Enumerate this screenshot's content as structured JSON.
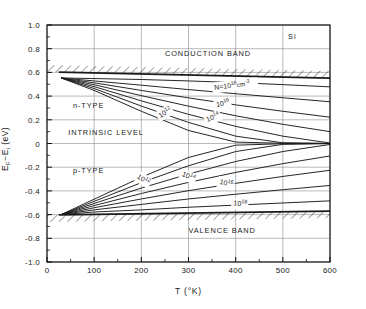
{
  "chart_data": {
    "type": "line",
    "title": "",
    "material_label": "Si",
    "xlabel": "T  (°K)",
    "ylabel_parts": {
      "main1": "E",
      "sub1": "F",
      "dash": "−",
      "main2": "E",
      "sub2": "i",
      "units": "  (eV)"
    },
    "ylabel": "E_F − E_i  (eV)",
    "xlim": [
      0,
      600
    ],
    "ylim": [
      -1.0,
      1.0
    ],
    "xticks": [
      0,
      100,
      200,
      300,
      400,
      500,
      600
    ],
    "xtick_labels": [
      "0",
      "100",
      "200",
      "300",
      "400",
      "500",
      "600"
    ],
    "xminor_step": 50,
    "yticks": [
      1.0,
      0.8,
      0.6,
      0.4,
      0.2,
      0,
      -0.2,
      -0.4,
      -0.6,
      -0.8,
      -1.0
    ],
    "ytick_labels": [
      "1.0",
      "0.8",
      "0.6",
      "0.4",
      "0.2",
      "0",
      "-0.2",
      "-0.4",
      "-0.6",
      "-0.8",
      "-1.0"
    ],
    "yminor_step": 0.1,
    "grid": true,
    "legend": "none",
    "annotations": [
      {
        "name": "conduction-band-label",
        "text": "CONDUCTION BAND",
        "x": 250,
        "y": 0.735
      },
      {
        "name": "valence-band-label",
        "text": "VALENCE BAND",
        "x": 300,
        "y": -0.755
      },
      {
        "name": "n-type-label",
        "text": "n-TYPE",
        "x": 55,
        "y": 0.3
      },
      {
        "name": "p-type-label",
        "text": "p-TYPE",
        "x": 55,
        "y": -0.245
      },
      {
        "name": "intrinsic-level-label",
        "text": "INTRINSIC LEVEL",
        "x": 45,
        "y": 0.075
      },
      {
        "name": "material-label",
        "text": "Si",
        "x": 520,
        "y": 0.885
      }
    ],
    "band_edges": [
      {
        "name": "conduction-band-edge",
        "points": [
          [
            25,
            0.603
          ],
          [
            600,
            0.552
          ]
        ],
        "hatch_side": "above"
      },
      {
        "name": "valence-band-edge",
        "points": [
          [
            25,
            -0.603
          ],
          [
            600,
            -0.57
          ]
        ],
        "hatch_side": "below"
      }
    ],
    "converge_point_n": [
      30,
      0.553
    ],
    "converge_point_p": [
      30,
      -0.6
    ],
    "series": [
      {
        "name": "n-type N=1e18",
        "label": "N=10",
        "label_exp": "18",
        "label_units": "cm",
        "label_units_exp": "-3",
        "doping": 1e+18,
        "type": "n",
        "points": [
          [
            30,
            0.553
          ],
          [
            100,
            0.548
          ],
          [
            200,
            0.54
          ],
          [
            300,
            0.528
          ],
          [
            400,
            0.514
          ],
          [
            500,
            0.497
          ],
          [
            600,
            0.478
          ]
        ]
      },
      {
        "name": "n-type 1e17",
        "label": "",
        "doping": 1e+17,
        "type": "n",
        "points": [
          [
            30,
            0.553
          ],
          [
            100,
            0.528
          ],
          [
            200,
            0.492
          ],
          [
            300,
            0.455
          ],
          [
            400,
            0.42
          ],
          [
            500,
            0.386
          ],
          [
            600,
            0.352
          ]
        ]
      },
      {
        "name": "n-type 1e16",
        "label": "10",
        "label_exp": "16",
        "doping": 1e+16,
        "type": "n",
        "points": [
          [
            30,
            0.553
          ],
          [
            100,
            0.512
          ],
          [
            200,
            0.448
          ],
          [
            300,
            0.385
          ],
          [
            400,
            0.326
          ],
          [
            500,
            0.272
          ],
          [
            600,
            0.222
          ]
        ]
      },
      {
        "name": "n-type 1e15",
        "label": "",
        "doping": 1000000000000000.0,
        "type": "n",
        "points": [
          [
            30,
            0.553
          ],
          [
            100,
            0.496
          ],
          [
            200,
            0.404
          ],
          [
            300,
            0.315
          ],
          [
            400,
            0.234
          ],
          [
            500,
            0.162
          ],
          [
            600,
            0.1
          ]
        ]
      },
      {
        "name": "n-type 1e14",
        "label": "10",
        "label_exp": "14",
        "doping": 100000000000000.0,
        "type": "n",
        "points": [
          [
            30,
            0.553
          ],
          [
            100,
            0.48
          ],
          [
            200,
            0.36
          ],
          [
            300,
            0.246
          ],
          [
            400,
            0.145
          ],
          [
            500,
            0.062
          ],
          [
            600,
            0.004
          ]
        ]
      },
      {
        "name": "n-type 1e13",
        "label": "",
        "doping": 10000000000000.0,
        "type": "n",
        "points": [
          [
            30,
            0.553
          ],
          [
            100,
            0.464
          ],
          [
            200,
            0.316
          ],
          [
            300,
            0.178
          ],
          [
            400,
            0.062
          ],
          [
            500,
            0.006
          ],
          [
            600,
            0.001
          ]
        ]
      },
      {
        "name": "n-type 1e12",
        "label": "10",
        "label_exp": "12",
        "doping": 1000000000000.0,
        "type": "n",
        "points": [
          [
            30,
            0.553
          ],
          [
            100,
            0.448
          ],
          [
            200,
            0.272
          ],
          [
            300,
            0.11
          ],
          [
            400,
            0.012
          ],
          [
            500,
            0.002
          ],
          [
            600,
            0.0
          ]
        ]
      },
      {
        "name": "p-type 1e12",
        "label": "10",
        "label_exp": "12",
        "doping": 1000000000000.0,
        "type": "p",
        "points": [
          [
            30,
            -0.6
          ],
          [
            100,
            -0.47
          ],
          [
            200,
            -0.285
          ],
          [
            300,
            -0.118
          ],
          [
            400,
            -0.014
          ],
          [
            500,
            -0.002
          ],
          [
            600,
            0.0
          ]
        ]
      },
      {
        "name": "p-type 1e13",
        "label": "",
        "doping": 10000000000000.0,
        "type": "p",
        "points": [
          [
            30,
            -0.6
          ],
          [
            100,
            -0.488
          ],
          [
            200,
            -0.33
          ],
          [
            300,
            -0.188
          ],
          [
            400,
            -0.068
          ],
          [
            500,
            -0.007
          ],
          [
            600,
            -0.001
          ]
        ]
      },
      {
        "name": "p-type 1e14",
        "label": "10",
        "label_exp": "14",
        "doping": 100000000000000.0,
        "type": "p",
        "points": [
          [
            30,
            -0.6
          ],
          [
            100,
            -0.506
          ],
          [
            200,
            -0.376
          ],
          [
            300,
            -0.258
          ],
          [
            400,
            -0.152
          ],
          [
            500,
            -0.068
          ],
          [
            600,
            -0.008
          ]
        ]
      },
      {
        "name": "p-type 1e15",
        "label": "",
        "doping": 1000000000000000.0,
        "type": "p",
        "points": [
          [
            30,
            -0.6
          ],
          [
            100,
            -0.524
          ],
          [
            200,
            -0.422
          ],
          [
            300,
            -0.328
          ],
          [
            400,
            -0.244
          ],
          [
            500,
            -0.17
          ],
          [
            600,
            -0.105
          ]
        ]
      },
      {
        "name": "p-type 1e16",
        "label": "10",
        "label_exp": "16",
        "doping": 1e+16,
        "type": "p",
        "points": [
          [
            30,
            -0.6
          ],
          [
            100,
            -0.542
          ],
          [
            200,
            -0.468
          ],
          [
            300,
            -0.398
          ],
          [
            400,
            -0.336
          ],
          [
            500,
            -0.278
          ],
          [
            600,
            -0.226
          ]
        ]
      },
      {
        "name": "p-type 1e17",
        "label": "",
        "doping": 1e+17,
        "type": "p",
        "points": [
          [
            30,
            -0.6
          ],
          [
            100,
            -0.56
          ],
          [
            200,
            -0.514
          ],
          [
            300,
            -0.468
          ],
          [
            400,
            -0.428
          ],
          [
            500,
            -0.39
          ],
          [
            600,
            -0.354
          ]
        ]
      },
      {
        "name": "p-type 1e18",
        "label": "10",
        "label_exp": "18",
        "doping": 1e+18,
        "type": "p",
        "points": [
          [
            30,
            -0.6
          ],
          [
            100,
            -0.578
          ],
          [
            200,
            -0.56
          ],
          [
            300,
            -0.538
          ],
          [
            400,
            -0.52
          ],
          [
            500,
            -0.502
          ],
          [
            600,
            -0.484
          ]
        ]
      }
    ],
    "curve_labels": [
      {
        "name": "curve-label-n-1e18",
        "mantissa": "N=10",
        "exp": "18",
        "tail": "cm",
        "tail_exp": "-3",
        "x": 355,
        "y": 0.452,
        "rot": -7
      },
      {
        "name": "curve-label-n-1e16",
        "mantissa": "10",
        "exp": "16",
        "x": 360,
        "y": 0.307,
        "rot": -13
      },
      {
        "name": "curve-label-n-1e14",
        "mantissa": "10",
        "exp": "14",
        "x": 340,
        "y": 0.182,
        "rot": -21
      },
      {
        "name": "curve-label-n-1e12",
        "mantissa": "10",
        "exp": "12",
        "x": 240,
        "y": 0.215,
        "rot": -30
      },
      {
        "name": "curve-label-p-1e12",
        "mantissa": "10",
        "exp": "12",
        "x": 190,
        "y": -0.29,
        "rot": 32
      },
      {
        "name": "curve-label-p-1e14",
        "mantissa": "10",
        "exp": "14",
        "x": 285,
        "y": -0.272,
        "rot": 23
      },
      {
        "name": "curve-label-p-1e16",
        "mantissa": "10",
        "exp": "16",
        "x": 365,
        "y": -0.34,
        "rot": 14
      },
      {
        "name": "curve-label-p-1e18",
        "mantissa": "10",
        "exp": "18",
        "x": 395,
        "y": -0.522,
        "rot": 5
      }
    ]
  },
  "colors": {
    "ink": "#1a1a1a",
    "grid": "#8c8c8c",
    "frame": "#111111",
    "background": "#ffffff"
  }
}
